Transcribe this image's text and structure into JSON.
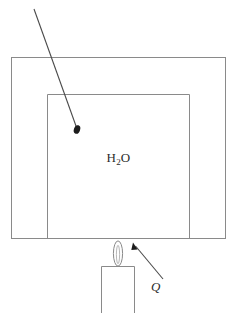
{
  "figure": {
    "background_color": "#ffffff",
    "line_color": "#8a8a8a",
    "text_color": "#2b2b2b",
    "width": 237,
    "height": 313
  },
  "labels": {
    "water_formula": "H",
    "water_subscript": "2",
    "water_formula_tail": "O",
    "water_full": "H2O",
    "heat_symbol": "Q"
  },
  "shapes": {
    "outer_vessel": {
      "name": "outer-vessel-rectangle",
      "x": 11,
      "y": 57,
      "width": 215,
      "height": 182
    },
    "inner_vessel": {
      "name": "inner-water-rectangle",
      "x": 47,
      "y": 94,
      "width": 143,
      "height": 145
    },
    "burner": {
      "name": "burner-box",
      "x": 101,
      "y": 266,
      "width": 34,
      "height": 47
    },
    "flame": {
      "name": "flame",
      "cx": 118,
      "cy": 253.5,
      "rx": 4.5,
      "ry": 12.5
    }
  },
  "annotations": {
    "water_pointer": {
      "name": "water-pointer-arrow",
      "from_x": 34,
      "from_y": 9,
      "to_x": 77,
      "to_y": 130
    },
    "heat_pointer": {
      "name": "heat-pointer-arrow",
      "from_x": 163,
      "from_y": 279,
      "to_x": 133,
      "to_y": 243
    }
  }
}
